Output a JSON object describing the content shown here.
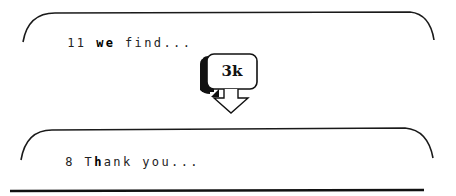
{
  "top_panel": {
    "count": "11",
    "word_pre": " ",
    "word_bold": "we",
    "rest": " find..."
  },
  "badge": {
    "label": "3k",
    "icon": "down-arrow-icon"
  },
  "bottom_panel": {
    "count": "8",
    "pre": " T",
    "bold": "h",
    "rest": "ank you..."
  },
  "colors": {
    "stroke": "#1a1a1a",
    "background": "#ffffff",
    "text": "#222222"
  }
}
